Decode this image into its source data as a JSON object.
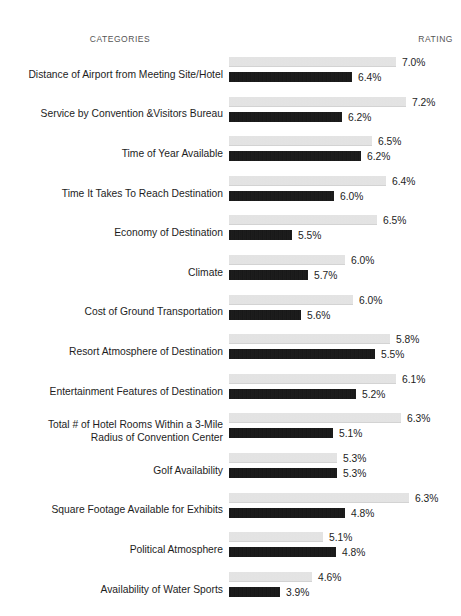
{
  "header": {
    "categories_label": "CATEGORIES",
    "rating_label": "RATING"
  },
  "colors": {
    "series_light": "#e7e7e7",
    "series_dark": "#161616",
    "text": "#1d1d1d",
    "header_text": "#555555",
    "background": "#ffffff"
  },
  "chart_data": {
    "type": "bar",
    "orientation": "horizontal",
    "title": "",
    "subtitle": "",
    "xlabel": "RATING",
    "ylabel": "CATEGORIES",
    "grid": false,
    "legend_position": "none",
    "value_suffix": "%",
    "categories": [
      "Distance of Airport from Meeting Site/Hotel",
      "Service by Convention &Visitors Bureau",
      "Time of Year Available",
      "Time It Takes To Reach Destination",
      "Economy of Destination",
      "Climate",
      "Cost of Ground Transportation",
      "Resort Atmosphere of Destination",
      "Entertainment Features of Destination",
      "Total # of Hotel Rooms Within a 3-Mile\nRadius of Convention Center",
      "Golf Availability",
      "Square Footage Available for Exhibits",
      "Political Atmosphere",
      "Availability of Water Sports"
    ],
    "series": [
      {
        "name": "series-light",
        "values": [
          7.0,
          7.2,
          6.5,
          6.4,
          6.5,
          6.0,
          6.0,
          5.8,
          6.1,
          6.3,
          5.3,
          6.3,
          5.1,
          4.6
        ],
        "labels": [
          "7.0%",
          "7.2%",
          "6.5%",
          "6.4%",
          "6.5%",
          "6.0%",
          "6.0%",
          "5.8%",
          "6.1%",
          "6.3%",
          "5.3%",
          "6.3%",
          "5.1%",
          "4.6%"
        ],
        "bar_px": [
          167,
          177,
          143,
          157,
          148,
          116,
          124,
          161,
          167,
          172,
          108,
          180,
          94,
          83
        ]
      },
      {
        "name": "series-dark",
        "values": [
          6.4,
          6.2,
          6.2,
          6.0,
          5.5,
          5.7,
          5.6,
          5.5,
          5.2,
          5.1,
          5.3,
          4.8,
          4.8,
          3.9
        ],
        "labels": [
          "6.4%",
          "6.2%",
          "6.2%",
          "6.0%",
          "5.5%",
          "5.7%",
          "5.6%",
          "5.5%",
          "5.2%",
          "5.1%",
          "5.3%",
          "4.8%",
          "4.8%",
          "3.9%"
        ],
        "bar_px": [
          123,
          113,
          132,
          105,
          63,
          79,
          72,
          146,
          127,
          104,
          108,
          116,
          107,
          51
        ]
      }
    ],
    "xlim": [
      0,
      7.5
    ]
  }
}
